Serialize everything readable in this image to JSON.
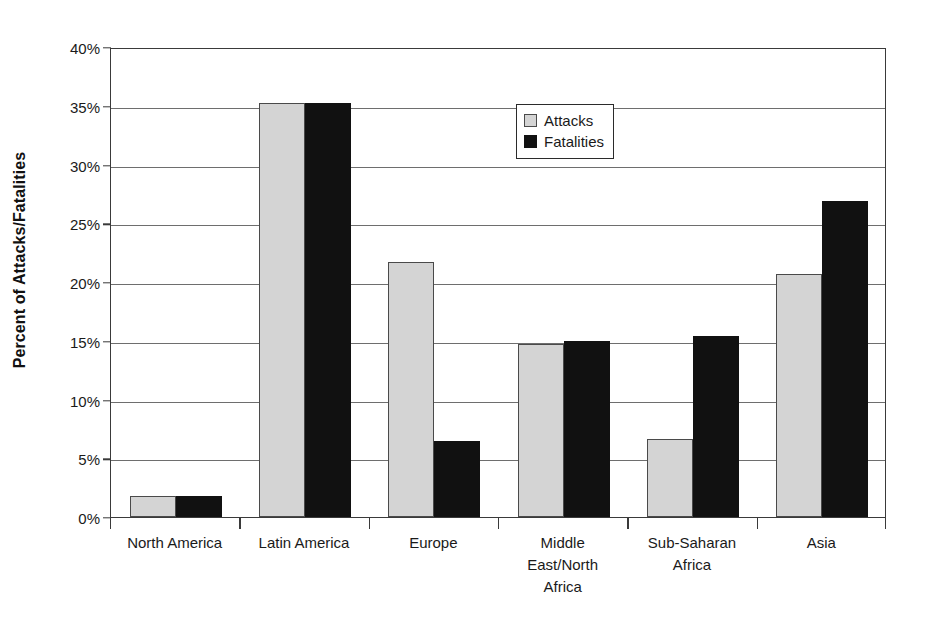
{
  "chart_data": {
    "type": "bar",
    "title": "",
    "xlabel": "",
    "ylabel": "Percent of Attacks/Fatalities",
    "ylim": [
      0,
      40
    ],
    "ytick_step": 5,
    "ytick_labels": [
      "40%",
      "35%",
      "30%",
      "25%",
      "20%",
      "15%",
      "10%",
      "5%",
      "0%"
    ],
    "ytick_values": [
      40,
      35,
      30,
      25,
      20,
      15,
      10,
      5,
      0
    ],
    "grid": true,
    "legend_position": "upper-center",
    "categories": [
      "North America",
      "Latin America",
      "Europe",
      "Middle East/North Africa",
      "Sub-Saharan Africa",
      "Asia"
    ],
    "category_lines": [
      [
        "North America"
      ],
      [
        "Latin America"
      ],
      [
        "Europe"
      ],
      [
        "Middle",
        "East/North",
        "Africa"
      ],
      [
        "Sub-Saharan",
        "Africa"
      ],
      [
        "Asia"
      ]
    ],
    "series": [
      {
        "name": "Attacks",
        "color": "#d4d4d4",
        "values": [
          1.8,
          35.2,
          21.7,
          14.7,
          6.6,
          20.7
        ]
      },
      {
        "name": "Fatalities",
        "color": "#111111",
        "values": [
          1.8,
          35.2,
          6.5,
          15.0,
          15.4,
          26.9
        ]
      }
    ]
  },
  "legend": {
    "items": [
      {
        "label": "Attacks",
        "swatch": "attacks"
      },
      {
        "label": "Fatalities",
        "swatch": "fatalities"
      }
    ]
  }
}
